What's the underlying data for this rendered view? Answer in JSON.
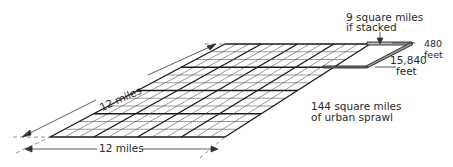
{
  "diagram": {
    "type": "isometric-grid",
    "labels": {
      "slanted_side": "12 miles",
      "bottom_side": "12 miles",
      "stacked_line1": "9 square miles",
      "stacked_line2": "if stacked",
      "height_value": "480",
      "height_unit": "feet",
      "length_value": "15,840",
      "length_unit": "feet",
      "sprawl_line1": "144 square miles",
      "sprawl_line2": "of urban sprawl"
    },
    "grid": {
      "rows": 12,
      "cols": 12,
      "bold_every": 3
    },
    "colors": {
      "line": "#1a1a1a",
      "thin": "#444444",
      "dash": "#777777",
      "bg": "#ffffff"
    }
  }
}
